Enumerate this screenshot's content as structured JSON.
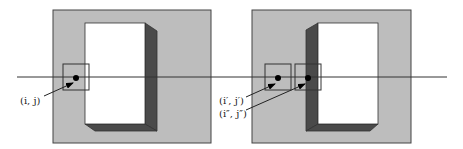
{
  "colors": {
    "background": "#ffffff",
    "panel_fill": "#bdbdbd",
    "panel_stroke": "#444444",
    "face_fill": "#ffffff",
    "shade_fill": "#4a4a4a",
    "line": "#333333",
    "dot": "#000000"
  },
  "scanline": {
    "y": 77,
    "x1": 17,
    "x2": 447
  },
  "panels": [
    {
      "name": "left-view",
      "frame": {
        "x": 53,
        "y": 10,
        "w": 158,
        "h": 133
      },
      "object_face": {
        "x": 85,
        "y": 23,
        "w": 60,
        "h": 101
      },
      "shade_side": "right",
      "windows": [
        {
          "x": 63,
          "y": 64,
          "w": 26,
          "h": 26,
          "dot": {
            "cx": 76,
            "cy": 78
          }
        }
      ]
    },
    {
      "name": "right-view",
      "frame": {
        "x": 252,
        "y": 10,
        "w": 159,
        "h": 133
      },
      "object_face": {
        "x": 318,
        "y": 23,
        "w": 60,
        "h": 101
      },
      "shade_side": "left",
      "windows": [
        {
          "x": 265,
          "y": 64,
          "w": 26,
          "h": 26,
          "dot": {
            "cx": 278,
            "cy": 78
          }
        },
        {
          "x": 295,
          "y": 64,
          "w": 26,
          "h": 26,
          "dot": {
            "cx": 308,
            "cy": 78
          }
        }
      ]
    }
  ],
  "labels": [
    {
      "id": "pixel-ij",
      "text": "(i, j)",
      "x": 20,
      "y": 104
    },
    {
      "id": "pixel-ij-prime",
      "text": "(i′, j′)",
      "x": 219,
      "y": 104
    },
    {
      "id": "pixel-ij-double-prime",
      "text": "(i″, j″)",
      "x": 219,
      "y": 117
    }
  ]
}
